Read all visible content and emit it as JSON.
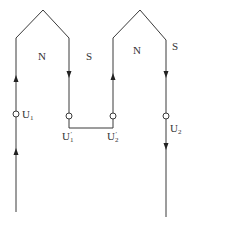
{
  "diagram": {
    "type": "two-coil winding connection (series, head-to-tail)",
    "coils": [
      {
        "id": "coil-1",
        "poles": [
          "N",
          "S"
        ],
        "start_terminal": "U1",
        "end_terminal": "U1'",
        "current_direction": "up left side, down right side"
      },
      {
        "id": "coil-2",
        "poles": [
          "N",
          "S"
        ],
        "start_terminal": "U2'",
        "end_terminal": "U2",
        "current_direction": "up left side, down right side"
      }
    ],
    "connection": "U1' connected to U2'"
  },
  "labels": {
    "pole_n_left": "N",
    "pole_s_left": "S",
    "pole_n_right": "N",
    "pole_s_right": "S",
    "u1": {
      "base": "U",
      "sub": "1",
      "prime": ""
    },
    "u1p": {
      "base": "U",
      "sub": "1",
      "prime": "′"
    },
    "u2p": {
      "base": "U",
      "sub": "2",
      "prime": "′"
    },
    "u2": {
      "base": "U",
      "sub": "2",
      "prime": ""
    }
  },
  "colors": {
    "line": "#3a3a3a",
    "background": "#ffffff"
  }
}
